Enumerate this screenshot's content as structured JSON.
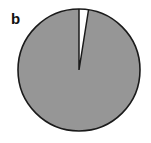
{
  "figure": {
    "panel_label": "b",
    "background_color": "#ffffff",
    "width": 151,
    "height": 143
  },
  "chart_data": {
    "type": "pie",
    "title": "b",
    "xlabel": "",
    "ylabel": "",
    "labels": [
      "Major fraction",
      "Minor fraction"
    ],
    "values": [
      97.5,
      2.5
    ],
    "value_unit": "percent",
    "start_angle_deg": 0,
    "direction": "clockwise",
    "center": {
      "cx": 79,
      "cy": 70
    },
    "radius": 61,
    "grid": false,
    "legend": "none",
    "slices": [
      {
        "label": "Major fraction",
        "value": 97.5,
        "sweep_deg": 351,
        "fill": "#969696",
        "stroke": "#1a1a1a"
      },
      {
        "label": "Minor fraction",
        "value": 2.5,
        "sweep_deg": 9,
        "fill": "#ffffff",
        "stroke": "#1a1a1a"
      }
    ],
    "colors": {
      "major_slice": "#969696",
      "minor_slice": "#ffffff",
      "outline": "#1a1a1a",
      "label_text": "#111111"
    },
    "stroke_width": 1.5,
    "annotations": []
  }
}
